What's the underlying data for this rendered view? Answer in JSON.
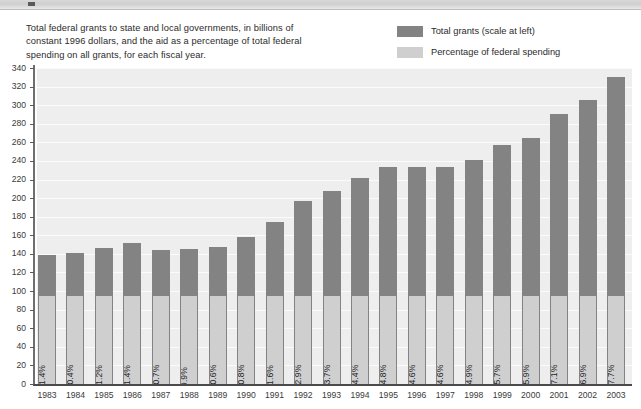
{
  "caption": "Total federal grants to state and local governments, in billions of constant 1996 dollars, and the aid as a percentage of total federal spending on all grants, for each fiscal year.",
  "legend": {
    "items": [
      {
        "label": "Total grants (scale at left)",
        "color": "#838383"
      },
      {
        "label": "Percentage of federal spending",
        "color": "#cfcfcf"
      }
    ]
  },
  "chart_data": {
    "type": "bar",
    "title": "",
    "subtitle": "",
    "xlabel": "",
    "ylabel": "",
    "ylim": [
      0,
      340
    ],
    "ytick_step": 20,
    "yticks": [
      0,
      20,
      40,
      60,
      80,
      100,
      120,
      140,
      160,
      180,
      200,
      220,
      240,
      260,
      280,
      300,
      320,
      340
    ],
    "grid": true,
    "legend_position": "top-right",
    "categories": [
      "1983",
      "1984",
      "1985",
      "1986",
      "1987",
      "1988",
      "1989",
      "1990",
      "1991",
      "1992",
      "1993",
      "1994",
      "1995",
      "1996",
      "1997",
      "1998",
      "1999",
      "2000",
      "2001",
      "2002",
      "2003"
    ],
    "series": [
      {
        "name": "Total grants (scale at left)",
        "color": "#838383",
        "unit": "billions of constant 1996 dollars",
        "values": [
          139,
          141,
          146,
          152,
          144,
          145,
          147,
          158,
          174,
          197,
          208,
          222,
          234,
          233,
          233,
          241,
          257,
          265,
          290,
          306,
          330
        ]
      },
      {
        "name": "Percentage of federal spending",
        "color": "#cfcfcf",
        "unit": "percent",
        "labels": [
          "11.4%",
          "10.4%",
          "11.2%",
          "11.4%",
          "10.7%",
          "9.9%",
          "10.6%",
          "10.8%",
          "11.6%",
          "12.9%",
          "13.7%",
          "14.4%",
          "14.8%",
          "14.6%",
          "14.6%",
          "14.9%",
          "15.7%",
          "15.9%",
          "17.1%",
          "16.9%",
          "17.7%"
        ],
        "values": [
          11.4,
          10.4,
          11.2,
          11.4,
          10.7,
          9.9,
          10.6,
          10.8,
          11.6,
          12.9,
          13.7,
          14.4,
          14.8,
          14.6,
          14.6,
          14.9,
          15.7,
          15.9,
          17.1,
          16.9,
          17.7
        ]
      }
    ]
  }
}
